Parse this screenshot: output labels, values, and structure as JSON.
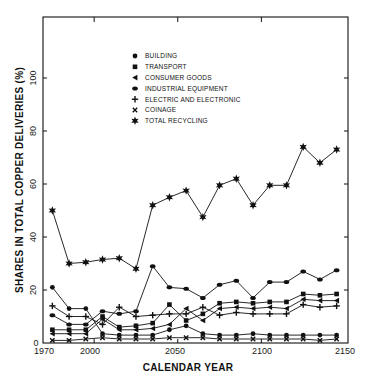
{
  "chart_data": {
    "type": "line",
    "title": "",
    "xlabel": "CALENDAR YEAR",
    "ylabel": "SHARES IN TOTAL COPPER DELIVERIES (%)",
    "xlim": [
      1970,
      2150
    ],
    "ylim": [
      0,
      120
    ],
    "x_ticks": [
      1970,
      2000,
      2050,
      2100,
      2150
    ],
    "y_ticks": [
      0,
      20,
      40,
      60,
      80,
      100
    ],
    "grid": false,
    "legend_position": "upper-left-inside",
    "x": [
      1975,
      1985,
      1995,
      2005,
      2015,
      2025,
      2035,
      2045,
      2055,
      2065,
      2075,
      2085,
      2095,
      2105,
      2115,
      2125,
      2135,
      2145
    ],
    "series": [
      {
        "name": "BUILDING",
        "marker": "circle",
        "values": [
          21,
          13,
          13,
          3.5,
          3,
          3,
          3,
          5,
          6.5,
          3.5,
          3,
          3,
          3.5,
          3,
          3,
          3,
          3,
          3
        ]
      },
      {
        "name": "TRANSPORT",
        "marker": "square",
        "values": [
          5,
          5,
          5,
          10,
          6,
          6.5,
          7.5,
          14.5,
          8.5,
          11,
          15,
          15.5,
          15,
          15.5,
          15.5,
          18.5,
          18,
          18.5
        ]
      },
      {
        "name": "CONSUMER GOODS",
        "marker": "triangle-left",
        "values": [
          3.5,
          3.5,
          3.5,
          9,
          5,
          5,
          5.5,
          7,
          13,
          8.5,
          13,
          13.5,
          13,
          13.5,
          13,
          16.5,
          16,
          16
        ]
      },
      {
        "name": "INDUSTRIAL EQUIPMENT",
        "marker": "diamond",
        "values": [
          10.5,
          7,
          7,
          12,
          11,
          12,
          29,
          21,
          20.5,
          17,
          22,
          23.5,
          17,
          23,
          23,
          27,
          24,
          27.5
        ]
      },
      {
        "name": "ELECTRIC AND ELECTRONIC",
        "marker": "plus",
        "values": [
          14,
          10,
          10,
          7,
          13.5,
          10,
          10.5,
          11,
          11,
          13.5,
          10.5,
          11.5,
          11,
          11,
          11,
          14.5,
          13.5,
          14
        ]
      },
      {
        "name": "COINAGE",
        "marker": "x",
        "values": [
          1,
          1,
          1.5,
          2,
          1.5,
          1.5,
          1.5,
          2,
          2,
          2,
          1.5,
          1.5,
          1.5,
          1.5,
          1.5,
          1.5,
          1,
          1.5
        ]
      },
      {
        "name": "TOTAL RECYCLING",
        "marker": "star",
        "values": [
          50,
          30,
          30.5,
          31.5,
          32,
          28,
          52,
          55,
          57.5,
          47.5,
          59.5,
          62,
          52,
          59.5,
          59.5,
          74,
          68,
          73
        ]
      }
    ]
  },
  "labels": {
    "xlabel": "CALENDAR YEAR",
    "ylabel": "SHARES IN TOTAL COPPER DELIVERIES (%)",
    "x_ticks": [
      "1970",
      "2000",
      "2050",
      "2100",
      "2150"
    ],
    "y_ticks": [
      "0",
      "20",
      "40",
      "60",
      "80",
      "100"
    ],
    "legend": [
      "BUILDING",
      "TRANSPORT",
      "CONSUMER GOODS",
      "INDUSTRIAL EQUIPMENT",
      "ELECTRIC AND ELECTRONIC",
      "COINAGE",
      "TOTAL RECYCLING"
    ]
  },
  "colors": {
    "ink": "#111111",
    "background": "#ffffff"
  }
}
